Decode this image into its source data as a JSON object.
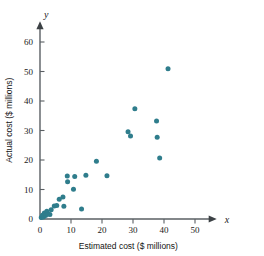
{
  "figure": {
    "background_color": "#ffffff",
    "axis_color": "#5a5f63",
    "point_color": "#2f7d8c"
  },
  "axes": {
    "x_axis_symbol": "x",
    "y_axis_symbol": "y",
    "x_title": "Estimated cost ($ millions)",
    "y_title": "Actual cost ($ millions)"
  },
  "chart_data": {
    "type": "scatter",
    "title": "",
    "xlabel": "Estimated cost ($ millions)",
    "ylabel": "Actual cost ($ millions)",
    "xlim": [
      0,
      57
    ],
    "ylim": [
      0,
      67
    ],
    "xticks": [
      0,
      10,
      20,
      30,
      40,
      50
    ],
    "yticks": [
      0,
      10,
      20,
      30,
      40,
      50,
      60
    ],
    "xtick_labels": [
      "0",
      "10",
      "20",
      "30",
      "40",
      "50"
    ],
    "ytick_labels": [
      "0",
      "10",
      "20",
      "30",
      "40",
      "50",
      "60"
    ],
    "grid": false,
    "legend": false,
    "marker": "circle",
    "marker_color": "#2f7d8c",
    "points": [
      {
        "x": 0.4,
        "y": 0.5
      },
      {
        "x": 0.8,
        "y": 1.3
      },
      {
        "x": 1.1,
        "y": 0.7
      },
      {
        "x": 1.4,
        "y": 2.0
      },
      {
        "x": 1.8,
        "y": 1.2
      },
      {
        "x": 2.2,
        "y": 2.6
      },
      {
        "x": 2.6,
        "y": 1.7
      },
      {
        "x": 3.2,
        "y": 1.5
      },
      {
        "x": 3.6,
        "y": 3.1
      },
      {
        "x": 4.6,
        "y": 4.4
      },
      {
        "x": 5.4,
        "y": 4.6
      },
      {
        "x": 6.2,
        "y": 6.7
      },
      {
        "x": 7.4,
        "y": 7.5
      },
      {
        "x": 7.7,
        "y": 4.3
      },
      {
        "x": 8.8,
        "y": 14.6
      },
      {
        "x": 8.9,
        "y": 12.6
      },
      {
        "x": 10.8,
        "y": 10.1
      },
      {
        "x": 11.2,
        "y": 14.4
      },
      {
        "x": 13.4,
        "y": 3.4
      },
      {
        "x": 14.8,
        "y": 14.8
      },
      {
        "x": 18.2,
        "y": 19.6
      },
      {
        "x": 21.6,
        "y": 14.7
      },
      {
        "x": 28.4,
        "y": 29.6
      },
      {
        "x": 29.2,
        "y": 28.1
      },
      {
        "x": 30.6,
        "y": 37.4
      },
      {
        "x": 37.6,
        "y": 33.2
      },
      {
        "x": 37.8,
        "y": 27.7
      },
      {
        "x": 38.6,
        "y": 20.7
      },
      {
        "x": 41.3,
        "y": 50.9
      }
    ]
  }
}
